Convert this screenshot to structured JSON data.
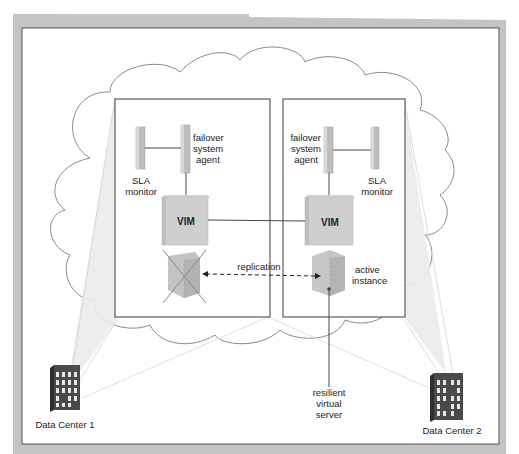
{
  "diagram": {
    "type": "cloud-failover-architecture",
    "colors": {
      "frame_border": "#b9b9b9",
      "frame_inner_line": "#555555",
      "cloud_outline": "#8a8a8a",
      "box_border": "#3a3a3a",
      "component_fill": "#c8c8c8",
      "beam_fill": "#e6e6e6",
      "building_fill": "#4a4a4a",
      "building_window": "#e8e8e8",
      "text": "#222222"
    },
    "left_zone": {
      "sla_monitor": {
        "label_line1": "SLA",
        "label_line2": "monitor"
      },
      "failover_agent": {
        "label_line1": "failover",
        "label_line2": "system",
        "label_line3": "agent"
      },
      "vim": {
        "label": "VIM"
      },
      "failed_server": {
        "state": "failed",
        "marker": "X"
      }
    },
    "right_zone": {
      "sla_monitor": {
        "label_line1": "SLA",
        "label_line2": "monitor"
      },
      "failover_agent": {
        "label_line1": "failover",
        "label_line2": "system",
        "label_line3": "agent"
      },
      "vim": {
        "label": "VIM"
      },
      "active_server": {
        "label_line1": "active",
        "label_line2": "instance"
      }
    },
    "replication": {
      "label": "replication",
      "style": "dashed-bidirectional"
    },
    "resilient_server": {
      "label_line1": "resilient",
      "label_line2": "virtual",
      "label_line3": "server"
    },
    "data_centers": [
      {
        "label": "Data Center 1"
      },
      {
        "label": "Data Center 2"
      }
    ]
  }
}
